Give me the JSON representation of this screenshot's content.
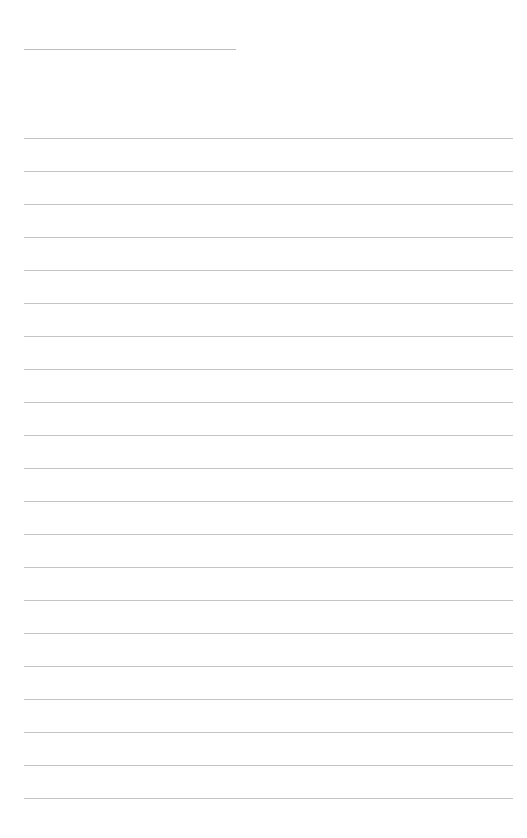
{
  "page": {
    "type": "lined-notes-page",
    "title_line": {
      "text": ""
    },
    "ruled_line_count": 21,
    "line_color": "#c4c4c4",
    "background": "#ffffff",
    "lines": [
      "",
      "",
      "",
      "",
      "",
      "",
      "",
      "",
      "",
      "",
      "",
      "",
      "",
      "",
      "",
      "",
      "",
      "",
      "",
      "",
      ""
    ]
  }
}
